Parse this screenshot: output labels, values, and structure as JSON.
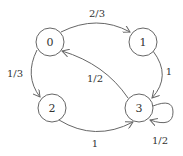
{
  "diagram": {
    "type": "state-transition-graph",
    "colors": {
      "stroke": "#666666",
      "text": "#333333",
      "background": "#ffffff"
    },
    "nodes": [
      {
        "id": "0",
        "label": "0"
      },
      {
        "id": "1",
        "label": "1"
      },
      {
        "id": "2",
        "label": "2"
      },
      {
        "id": "3",
        "label": "3"
      }
    ],
    "edges": [
      {
        "from": "0",
        "to": "1",
        "label": "2/3"
      },
      {
        "from": "0",
        "to": "2",
        "label": "1/3"
      },
      {
        "from": "1",
        "to": "3",
        "label": "1"
      },
      {
        "from": "3",
        "to": "0",
        "label": "1/2"
      },
      {
        "from": "2",
        "to": "3",
        "label": "1"
      },
      {
        "from": "3",
        "to": "3",
        "label": "1/2"
      }
    ]
  }
}
